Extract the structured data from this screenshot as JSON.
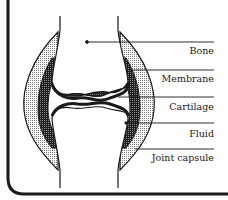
{
  "diagram": {
    "labels": [
      {
        "id": "bone",
        "text": "Bone",
        "top": 46
      },
      {
        "id": "membrane",
        "text": "Membrane",
        "top": 74
      },
      {
        "id": "cartilage",
        "text": "Cartilage",
        "top": 102
      },
      {
        "id": "fluid",
        "text": "Fluid",
        "top": 129
      },
      {
        "id": "joint-capsule",
        "text": "Joint capsule",
        "top": 153
      }
    ],
    "colors": {
      "ink": "#1a1a1a",
      "stipple_light": "#bdbdbd",
      "stipple_dark": "#3a3a3a",
      "background": "#ffffff"
    }
  }
}
